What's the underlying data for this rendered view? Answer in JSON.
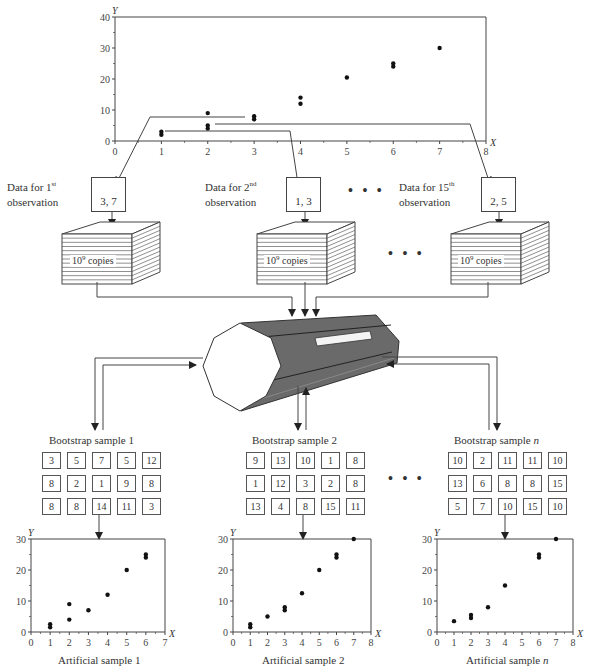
{
  "colors": {
    "line": "#444444",
    "cylinder_fill": "#666666",
    "cylinder_dark": "#4a4a4a",
    "point": "#111111"
  },
  "observations": [
    {
      "label_prefix": "Data for 1",
      "ordinal": "st",
      "label_line2": "observation",
      "value": "3, 7"
    },
    {
      "label_prefix": "Data for 2",
      "ordinal": "nd",
      "label_line2": "observation",
      "value": "1, 3"
    },
    {
      "label_prefix": "Data for 15",
      "ordinal": "th",
      "label_line2": "observation",
      "value": "2, 5"
    }
  ],
  "ellipsis": "• • •",
  "copies": {
    "base": "10",
    "exponent": "9",
    "suffix": " copies"
  },
  "bootstrap_samples": [
    {
      "title": "Bootstrap sample 1",
      "title_italic_suffix": "",
      "grid": [
        [
          "3",
          "5",
          "7",
          "5",
          "12"
        ],
        [
          "8",
          "2",
          "1",
          "9",
          "8"
        ],
        [
          "8",
          "8",
          "14",
          "11",
          "3"
        ]
      ],
      "caption": "Artificial sample 1",
      "caption_italic_suffix": ""
    },
    {
      "title": "Bootstrap sample 2",
      "title_italic_suffix": "",
      "grid": [
        [
          "9",
          "13",
          "10",
          "1",
          "8"
        ],
        [
          "1",
          "12",
          "3",
          "2",
          "8"
        ],
        [
          "13",
          "4",
          "8",
          "15",
          "11"
        ]
      ],
      "caption": "Artificial sample 2",
      "caption_italic_suffix": ""
    },
    {
      "title": "Bootstrap sample ",
      "title_italic_suffix": "n",
      "grid": [
        [
          "10",
          "2",
          "11",
          "11",
          "10"
        ],
        [
          "13",
          "6",
          "8",
          "8",
          "15"
        ],
        [
          "5",
          "7",
          "10",
          "15",
          "10"
        ]
      ],
      "caption": "Artificial sample ",
      "caption_italic_suffix": "n"
    }
  ],
  "chart_data": [
    {
      "type": "scatter",
      "title": "Original sample (15 observations)",
      "xlabel": "X",
      "ylabel": "Y",
      "xlim": [
        0,
        8
      ],
      "ylim": [
        0,
        40
      ],
      "xticks": [
        0,
        1,
        2,
        3,
        4,
        5,
        6,
        7,
        8
      ],
      "yticks": [
        0,
        10,
        20,
        30,
        40
      ],
      "points": [
        [
          1,
          2
        ],
        [
          1,
          3
        ],
        [
          2,
          4
        ],
        [
          2,
          5
        ],
        [
          2,
          9
        ],
        [
          3,
          7
        ],
        [
          3,
          8
        ],
        [
          4,
          12
        ],
        [
          4,
          14
        ],
        [
          5,
          20.5
        ],
        [
          6,
          24
        ],
        [
          6,
          25
        ],
        [
          7,
          30
        ]
      ]
    },
    {
      "type": "scatter",
      "title": "Artificial sample 1",
      "xlabel": "X",
      "ylabel": "Y",
      "xlim": [
        0,
        7
      ],
      "ylim": [
        0,
        30
      ],
      "xticks": [
        0,
        1,
        2,
        3,
        4,
        5,
        6,
        7
      ],
      "yticks": [
        0,
        10,
        20,
        30
      ],
      "points": [
        [
          1,
          1.5
        ],
        [
          1,
          2.5
        ],
        [
          2,
          4
        ],
        [
          2,
          9
        ],
        [
          3,
          7
        ],
        [
          4,
          12
        ],
        [
          5,
          20
        ],
        [
          6,
          24
        ],
        [
          6,
          25
        ]
      ]
    },
    {
      "type": "scatter",
      "title": "Artificial sample 2",
      "xlabel": "X",
      "ylabel": "Y",
      "xlim": [
        0,
        8
      ],
      "ylim": [
        0,
        30
      ],
      "xticks": [
        0,
        1,
        2,
        3,
        4,
        5,
        6,
        7,
        8
      ],
      "yticks": [
        0,
        10,
        20,
        30
      ],
      "points": [
        [
          1,
          1.5
        ],
        [
          1,
          2.5
        ],
        [
          2,
          5
        ],
        [
          3,
          7
        ],
        [
          3,
          8
        ],
        [
          4,
          12.5
        ],
        [
          5,
          20
        ],
        [
          6,
          24
        ],
        [
          6,
          25
        ],
        [
          7,
          30
        ]
      ]
    },
    {
      "type": "scatter",
      "title": "Artificial sample n",
      "xlabel": "X",
      "ylabel": "Y",
      "xlim": [
        0,
        8
      ],
      "ylim": [
        0,
        30
      ],
      "xticks": [
        0,
        1,
        2,
        3,
        4,
        5,
        6,
        7,
        8
      ],
      "yticks": [
        0,
        10,
        20,
        30
      ],
      "points": [
        [
          1,
          3.5
        ],
        [
          2,
          4.5
        ],
        [
          2,
          5.5
        ],
        [
          3,
          8
        ],
        [
          4,
          15
        ],
        [
          6,
          24
        ],
        [
          6,
          25
        ],
        [
          7,
          30
        ]
      ]
    }
  ]
}
